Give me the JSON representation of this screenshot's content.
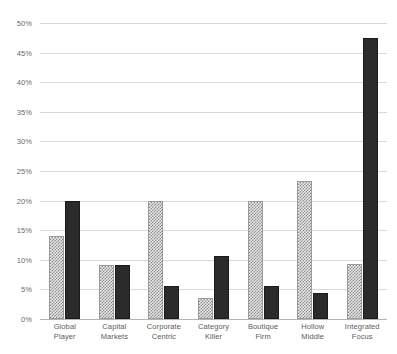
{
  "chart_data": {
    "type": "bar",
    "title": "",
    "subtitle": "",
    "xlabel": "",
    "ylabel": "",
    "ylim": [
      0,
      50
    ],
    "ytick_labels": [
      "50%",
      "45%",
      "40%",
      "35%",
      "30%",
      "25%",
      "20%",
      "15%",
      "10%",
      "5%",
      "0%"
    ],
    "ytick_values": [
      50,
      45,
      40,
      35,
      30,
      25,
      20,
      15,
      10,
      5,
      0
    ],
    "grid": true,
    "legend": "none",
    "categories": [
      "Global Player",
      "Capital Markets",
      "Corporate Centric",
      "Category Killer",
      "Boutique Firm",
      "Hollow Middle",
      "Integrated Focus"
    ],
    "category_lines": [
      [
        "Global",
        "Player"
      ],
      [
        "Capital",
        "Markets"
      ],
      [
        "Corporate",
        "Centric"
      ],
      [
        "Category",
        "Killer"
      ],
      [
        "Boutique",
        "Firm"
      ],
      [
        "Hollow",
        "Middle"
      ],
      [
        "Integrated",
        "Focus"
      ]
    ],
    "series": [
      {
        "name": "series-dotted",
        "style": "checkered",
        "color": "#e9e9e9",
        "values": [
          14.0,
          9.2,
          20.0,
          3.5,
          20.0,
          23.3,
          9.3
        ]
      },
      {
        "name": "series-solid",
        "style": "solid",
        "color": "#2b2b2b",
        "values": [
          20.0,
          9.2,
          5.6,
          10.6,
          5.6,
          4.4,
          47.5
        ]
      }
    ]
  },
  "colors": {
    "gridline": "#d8d8d8",
    "baseline": "#b3b3b3",
    "tick_text": "#6b6b6b",
    "label_text": "#5c5c5c",
    "background": "#ffffff"
  }
}
